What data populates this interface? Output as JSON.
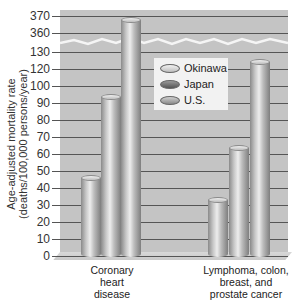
{
  "chart_data": {
    "type": "bar",
    "title": "",
    "xlabel": "",
    "ylabel": "Age-adjusted mortality rate (deaths/100,000 persons/year)",
    "categories": [
      "Coronary heart disease",
      "Lymphoma, colon, breast, and prostate cancer"
    ],
    "series": [
      {
        "name": "Okinawa",
        "values": [
          46,
          33
        ]
      },
      {
        "name": "Japan",
        "values": [
          94,
          64
        ]
      },
      {
        "name": "U.S.",
        "values": [
          368,
          124
        ]
      }
    ],
    "y_ticks": [
      "0",
      "10",
      "20",
      "30",
      "40",
      "50",
      "60",
      "70",
      "80",
      "90",
      "100",
      "120",
      "130",
      "360",
      "370"
    ],
    "axis_break": "between 130 and 360",
    "ylim": [
      0,
      370
    ],
    "grid": true,
    "legend_position": "inside upper center"
  },
  "axis": {
    "ylabel_line1": "Age-adjusted mortality rate",
    "ylabel_line2": "(deaths/100,000 persons/year)",
    "ticks": [
      {
        "label": "370",
        "y": 16
      },
      {
        "label": "360",
        "y": 33
      },
      {
        "label": "130",
        "y": 52
      },
      {
        "label": "120",
        "y": 69
      },
      {
        "label": "100",
        "y": 86
      },
      {
        "label": "90",
        "y": 103
      },
      {
        "label": "80",
        "y": 120
      },
      {
        "label": "70",
        "y": 137
      },
      {
        "label": "60",
        "y": 154
      },
      {
        "label": "50",
        "y": 171
      },
      {
        "label": "40",
        "y": 188
      },
      {
        "label": "30",
        "y": 205
      },
      {
        "label": "20",
        "y": 222
      },
      {
        "label": "10",
        "y": 239
      },
      {
        "label": "0",
        "y": 256
      }
    ]
  },
  "legend": {
    "items": [
      {
        "label": "Okinawa",
        "color": "#d9d9d9"
      },
      {
        "label": "Japan",
        "color": "#6f6f6f"
      },
      {
        "label": "U.S.",
        "color": "#a8a8a8"
      }
    ]
  },
  "categories": {
    "coronary": {
      "line1": "Coronary",
      "line2": "heart",
      "line3": "disease"
    },
    "cancer": {
      "line1": "Lymphoma, colon,",
      "line2": "breast, and",
      "line3": "prostate cancer"
    }
  }
}
